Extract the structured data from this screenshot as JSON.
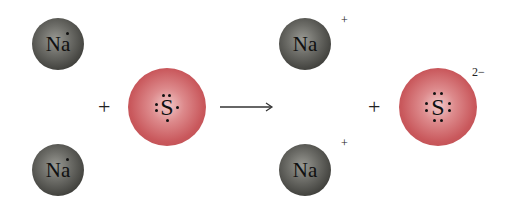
{
  "reaction": {
    "reactants": [
      {
        "symbol": "Na",
        "valence_dots": 1,
        "charge": ""
      },
      {
        "symbol": "Na",
        "valence_dots": 1,
        "charge": ""
      },
      {
        "symbol": "S",
        "valence_dots": 6,
        "charge": ""
      }
    ],
    "operators": {
      "plus_left": "+",
      "plus_right": "+"
    },
    "products": [
      {
        "symbol": "Na",
        "valence_dots": 0,
        "charge": "+"
      },
      {
        "symbol": "Na",
        "valence_dots": 0,
        "charge": "+"
      },
      {
        "symbol": "S",
        "valence_dots": 8,
        "charge": "2−"
      }
    ]
  },
  "colors": {
    "sodium": "#5a5a55",
    "sulfur": "#cf6a6d",
    "text": "#111111"
  }
}
